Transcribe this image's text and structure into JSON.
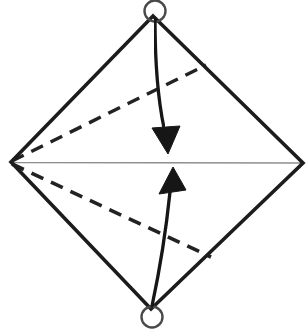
{
  "diagram": {
    "canvas": {
      "width": 306,
      "height": 333,
      "background": "#ffffff"
    },
    "colors": {
      "edge": "#1c1c1c",
      "fold_dashed": "#222222",
      "crease": "#8f8f8f",
      "corner_marker": "#4a4a4a",
      "arrow": "#141414"
    },
    "paper_outline": {
      "points": "153,16 303,163 151,309 11,162",
      "stroke_width": 3.6
    },
    "crease_line": {
      "x1": 11,
      "y1": 162.5,
      "x2": 303,
      "y2": 163,
      "stroke_width": 1.4
    },
    "dashed_fold_lines": [
      {
        "name": "upper-fold-line",
        "x1": 12,
        "y1": 161,
        "x2": 206,
        "y2": 65,
        "stroke_width": 3.4,
        "dash": "13 8.5"
      },
      {
        "name": "lower-fold-line",
        "x1": 12,
        "y1": 164,
        "x2": 211,
        "y2": 257,
        "stroke_width": 3.6,
        "dash": "13 8.5"
      }
    ],
    "corner_markers": [
      {
        "name": "top-corner-marker-circle",
        "cx": 155,
        "cy": 11,
        "r": 10.5,
        "stroke_width": 2.4
      },
      {
        "name": "bottom-corner-marker-circle",
        "cx": 152,
        "cy": 317,
        "r": 10.5,
        "stroke_width": 2.4
      }
    ],
    "fold_arrows": [
      {
        "name": "fold-down-arrow",
        "shaft": "M155,19 Q155,85 164,128",
        "head": "152,128 180,126 168,154",
        "stroke_width": 3.3
      },
      {
        "name": "fold-up-arrow",
        "shaft": "M152,306 Q164,250 170,192",
        "head": "159,194 186,190 173,167",
        "stroke_width": 3.3
      }
    ]
  }
}
